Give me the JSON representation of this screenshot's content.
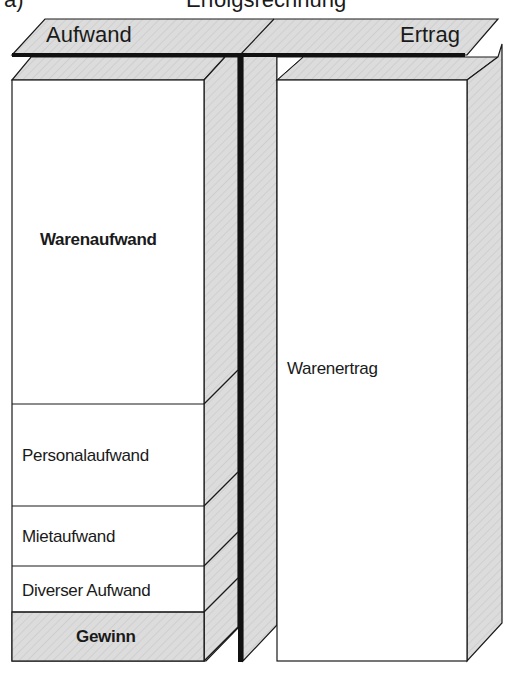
{
  "title": {
    "letter": "a)",
    "text": "Erfolgsrechnung"
  },
  "header": {
    "left": "Aufwand",
    "right": "Ertrag"
  },
  "aufwand_sections": [
    {
      "label": "Warenaufwand",
      "bold": true,
      "fill": "white"
    },
    {
      "label": "Personalaufwand",
      "bold": false,
      "fill": "white"
    },
    {
      "label": "Mietaufwand",
      "bold": false,
      "fill": "white"
    },
    {
      "label": "Diverser Aufwand",
      "bold": false,
      "fill": "white"
    },
    {
      "label": "Gewinn",
      "bold": true,
      "fill": "gray"
    }
  ],
  "ertrag_sections": [
    {
      "label": "Warenertrag",
      "bold": false,
      "fill": "white"
    }
  ],
  "colors": {
    "face_gray": "#dcdcdc",
    "line": "#1a1a1a",
    "white": "#ffffff"
  }
}
